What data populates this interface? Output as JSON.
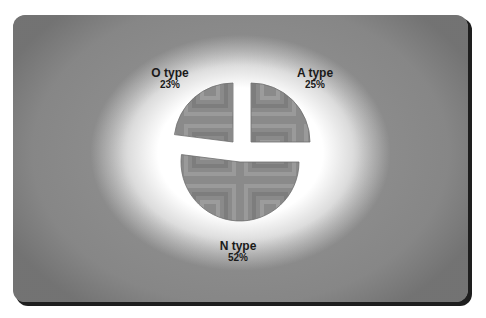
{
  "chart_data": {
    "type": "pie",
    "title": "",
    "categories": [
      "O type",
      "A type",
      "N type"
    ],
    "values": [
      23,
      25,
      52
    ],
    "labels": [
      {
        "name": "O type",
        "percent": "23%"
      },
      {
        "name": "A type",
        "percent": "25%"
      },
      {
        "name": "N type",
        "percent": "52%"
      }
    ],
    "exploded": true,
    "legend": "none",
    "data_labels": "outside",
    "slice_fill": "#8a8a8a",
    "slice_pattern": "concentric-squares"
  },
  "panel": {
    "background": "#8e8e8e",
    "glow": "#ffffff",
    "shadow": "#1e1e1e"
  }
}
